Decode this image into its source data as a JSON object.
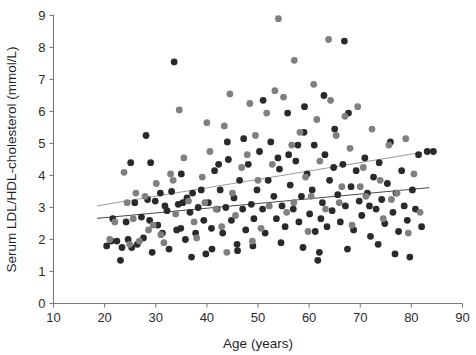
{
  "chart_data": {
    "type": "scatter",
    "title": "",
    "xlabel": "Age (years)",
    "ylabel": "Serum LDL/HDL-cholesterol  (mmol/L)",
    "xlim": [
      10,
      90
    ],
    "ylim": [
      0,
      9
    ],
    "xticks": [
      10,
      20,
      30,
      40,
      50,
      60,
      70,
      80,
      90
    ],
    "yticks": [
      0,
      1,
      2,
      3,
      4,
      5,
      6,
      7,
      8,
      9
    ],
    "grid": false,
    "legend": "none",
    "colors": {
      "series_dark": "#2a2a2a",
      "series_gray": "#808080",
      "fit_dark": "#4a4a4a",
      "fit_gray": "#9a9a9a",
      "axis": "#7a7a7a",
      "text": "#1f1f1f",
      "background": "#ffffff"
    },
    "marker": {
      "shape": "circle",
      "radius_px": 3.4
    },
    "series": [
      {
        "name": "series-dark",
        "color": "#2a2a2a",
        "points": [
          [
            20.4,
            1.8
          ],
          [
            21.3,
            1.95
          ],
          [
            21.6,
            2.65
          ],
          [
            22.4,
            1.95
          ],
          [
            23.1,
            1.35
          ],
          [
            23.4,
            1.75
          ],
          [
            24.2,
            2.55
          ],
          [
            24.6,
            2.0
          ],
          [
            25.1,
            4.4
          ],
          [
            25.3,
            1.75
          ],
          [
            25.9,
            3.15
          ],
          [
            26.4,
            1.85
          ],
          [
            27.2,
            2.7
          ],
          [
            27.6,
            2.05
          ],
          [
            28.1,
            5.25
          ],
          [
            28.4,
            3.25
          ],
          [
            28.8,
            2.6
          ],
          [
            29.3,
            1.6
          ],
          [
            29.9,
            3.2
          ],
          [
            30.4,
            2.45
          ],
          [
            30.9,
            3.45
          ],
          [
            31.3,
            2.2
          ],
          [
            31.8,
            3.05
          ],
          [
            32.2,
            2.9
          ],
          [
            32.6,
            1.7
          ],
          [
            33.1,
            3.5
          ],
          [
            33.6,
            7.55
          ],
          [
            34.1,
            2.3
          ],
          [
            34.4,
            3.1
          ],
          [
            34.9,
            2.35
          ],
          [
            35.3,
            3.15
          ],
          [
            35.8,
            2.0
          ],
          [
            36.1,
            3.3
          ],
          [
            36.7,
            2.85
          ],
          [
            37.2,
            3.45
          ],
          [
            37.8,
            2.2
          ],
          [
            38.3,
            3.0
          ],
          [
            38.9,
            3.55
          ],
          [
            39.4,
            2.6
          ],
          [
            39.8,
            1.55
          ],
          [
            40.3,
            3.15
          ],
          [
            40.9,
            2.35
          ],
          [
            41.5,
            4.15
          ],
          [
            42.0,
            2.95
          ],
          [
            42.6,
            3.55
          ],
          [
            43.1,
            2.2
          ],
          [
            43.7,
            3.0
          ],
          [
            44.2,
            4.5
          ],
          [
            44.8,
            2.6
          ],
          [
            45.3,
            3.3
          ],
          [
            45.9,
            1.85
          ],
          [
            46.4,
            3.85
          ],
          [
            47.0,
            2.95
          ],
          [
            47.6,
            2.3
          ],
          [
            48.1,
            4.35
          ],
          [
            48.7,
            3.1
          ],
          [
            49.2,
            2.65
          ],
          [
            49.8,
            3.55
          ],
          [
            50.3,
            4.75
          ],
          [
            50.9,
            2.95
          ],
          [
            51.4,
            2.2
          ],
          [
            52.0,
            3.85
          ],
          [
            52.5,
            5.05
          ],
          [
            53.1,
            3.35
          ],
          [
            53.6,
            2.65
          ],
          [
            54.2,
            4.2
          ],
          [
            54.7,
            3.05
          ],
          [
            55.3,
            2.4
          ],
          [
            55.8,
            5.95
          ],
          [
            56.3,
            3.7
          ],
          [
            56.9,
            2.95
          ],
          [
            57.4,
            4.45
          ],
          [
            58.0,
            2.55
          ],
          [
            58.5,
            3.35
          ],
          [
            59.1,
            6.15
          ],
          [
            59.6,
            4.05
          ],
          [
            60.1,
            2.8
          ],
          [
            60.6,
            3.55
          ],
          [
            61.2,
            2.25
          ],
          [
            61.7,
            1.35
          ],
          [
            62.0,
            1.6
          ],
          [
            62.3,
            2.65
          ],
          [
            62.6,
            3.15
          ],
          [
            63.1,
            4.65
          ],
          [
            63.5,
            2.4
          ],
          [
            64.0,
            3.85
          ],
          [
            64.5,
            2.9
          ],
          [
            65.0,
            5.45
          ],
          [
            65.6,
            3.4
          ],
          [
            66.1,
            2.55
          ],
          [
            66.6,
            4.35
          ],
          [
            67.1,
            3.05
          ],
          [
            67.7,
            5.95
          ],
          [
            68.2,
            3.65
          ],
          [
            68.7,
            2.3
          ],
          [
            69.2,
            4.15
          ],
          [
            69.8,
            3.2
          ],
          [
            70.3,
            2.75
          ],
          [
            70.9,
            4.55
          ],
          [
            71.4,
            3.45
          ],
          [
            72.0,
            2.1
          ],
          [
            72.6,
            3.95
          ],
          [
            73.1,
            2.95
          ],
          [
            73.7,
            4.4
          ],
          [
            74.2,
            3.25
          ],
          [
            74.8,
            2.5
          ],
          [
            75.3,
            3.75
          ],
          [
            75.9,
            5.05
          ],
          [
            76.4,
            2.85
          ],
          [
            77.0,
            3.45
          ],
          [
            77.5,
            2.25
          ],
          [
            78.1,
            4.15
          ],
          [
            78.6,
            3.05
          ],
          [
            79.2,
            2.6
          ],
          [
            79.7,
            1.45
          ],
          [
            80.2,
            3.55
          ],
          [
            80.8,
            2.95
          ],
          [
            81.4,
            4.65
          ],
          [
            82.0,
            2.4
          ],
          [
            83.1,
            4.75
          ],
          [
            84.3,
            4.75
          ],
          [
            57.8,
            4.95
          ],
          [
            61.0,
            4.95
          ],
          [
            59.0,
            5.35
          ],
          [
            53.9,
            4.55
          ],
          [
            47.2,
            5.15
          ],
          [
            44.0,
            5.05
          ],
          [
            51.0,
            6.35
          ],
          [
            62.9,
            6.5
          ],
          [
            66.9,
            8.2
          ],
          [
            29.0,
            4.4
          ],
          [
            42.3,
            4.35
          ],
          [
            56.0,
            4.65
          ],
          [
            64.8,
            4.25
          ],
          [
            71.8,
            3.05
          ],
          [
            35.0,
            4.05
          ],
          [
            37.0,
            1.45
          ],
          [
            41.0,
            1.7
          ],
          [
            46.0,
            1.65
          ],
          [
            49.0,
            1.8
          ],
          [
            54.5,
            1.9
          ],
          [
            58.8,
            1.75
          ],
          [
            67.5,
            1.7
          ],
          [
            73.5,
            1.85
          ],
          [
            76.8,
            1.55
          ]
        ]
      },
      {
        "name": "series-gray",
        "color": "#808080",
        "points": [
          [
            22.0,
            2.55
          ],
          [
            23.8,
            4.1
          ],
          [
            24.4,
            3.15
          ],
          [
            25.6,
            2.65
          ],
          [
            26.8,
            1.95
          ],
          [
            27.9,
            3.35
          ],
          [
            29.5,
            2.45
          ],
          [
            30.1,
            3.75
          ],
          [
            31.0,
            2.15
          ],
          [
            32.9,
            4.05
          ],
          [
            33.9,
            2.8
          ],
          [
            35.5,
            4.55
          ],
          [
            36.4,
            3.2
          ],
          [
            38.0,
            2.05
          ],
          [
            39.1,
            3.95
          ],
          [
            40.6,
            4.75
          ],
          [
            41.8,
            2.95
          ],
          [
            43.4,
            5.55
          ],
          [
            45.0,
            3.45
          ],
          [
            46.8,
            4.25
          ],
          [
            48.4,
            6.25
          ],
          [
            50.0,
            3.85
          ],
          [
            51.7,
            5.95
          ],
          [
            52.8,
            4.35
          ],
          [
            54.0,
            8.9
          ],
          [
            55.0,
            6.45
          ],
          [
            56.6,
            4.95
          ],
          [
            57.1,
            7.6
          ],
          [
            58.2,
            5.35
          ],
          [
            59.3,
            3.95
          ],
          [
            60.9,
            6.85
          ],
          [
            62.1,
            4.45
          ],
          [
            63.8,
            8.25
          ],
          [
            65.3,
            5.25
          ],
          [
            66.4,
            3.65
          ],
          [
            68.0,
            4.85
          ],
          [
            69.5,
            6.15
          ],
          [
            70.6,
            4.25
          ],
          [
            72.3,
            5.45
          ],
          [
            73.9,
            3.85
          ],
          [
            75.6,
            4.95
          ],
          [
            77.2,
            3.45
          ],
          [
            78.9,
            5.15
          ],
          [
            80.5,
            4.05
          ],
          [
            81.7,
            2.85
          ],
          [
            34.6,
            6.05
          ],
          [
            40.0,
            5.65
          ],
          [
            44.5,
            6.55
          ],
          [
            47.9,
            4.65
          ],
          [
            49.5,
            5.25
          ],
          [
            53.3,
            6.65
          ],
          [
            61.5,
            5.75
          ],
          [
            64.2,
            6.35
          ],
          [
            67.0,
            5.85
          ],
          [
            71.1,
            3.35
          ],
          [
            26.1,
            3.45
          ],
          [
            28.6,
            2.3
          ],
          [
            37.5,
            2.55
          ],
          [
            42.9,
            2.4
          ],
          [
            45.6,
            2.75
          ],
          [
            50.6,
            2.35
          ],
          [
            55.6,
            2.85
          ],
          [
            59.8,
            2.25
          ],
          [
            63.2,
            2.95
          ],
          [
            68.4,
            2.45
          ],
          [
            74.5,
            2.65
          ],
          [
            79.4,
            2.2
          ],
          [
            33.4,
            3.85
          ],
          [
            39.6,
            3.15
          ],
          [
            52.2,
            3.05
          ],
          [
            57.0,
            3.15
          ],
          [
            60.4,
            3.35
          ],
          [
            65.9,
            3.15
          ],
          [
            70.0,
            3.65
          ],
          [
            76.1,
            3.25
          ],
          [
            21.0,
            2.0
          ],
          [
            24.9,
            1.85
          ],
          [
            31.6,
            1.9
          ],
          [
            43.9,
            1.6
          ],
          [
            48.9,
            1.95
          ]
        ]
      }
    ],
    "fit_lines": [
      {
        "name": "fit-gray-upper",
        "color": "#9a9a9a",
        "x_start": 18.5,
        "y_start": 3.05,
        "x_end": 82.0,
        "y_end": 4.72,
        "width_px": 1.0
      },
      {
        "name": "fit-dark-lower",
        "color": "#4a4a4a",
        "x_start": 18.5,
        "y_start": 2.66,
        "x_end": 83.5,
        "y_end": 3.62,
        "width_px": 1.0
      }
    ]
  }
}
